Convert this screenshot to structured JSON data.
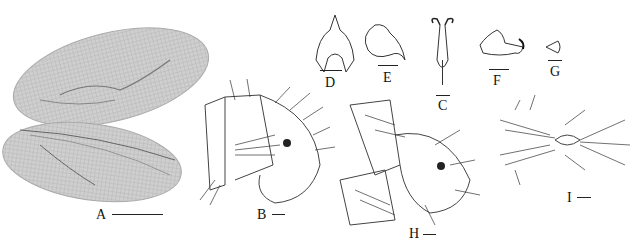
{
  "figure": {
    "panels": [
      {
        "id": "A",
        "label": "A",
        "description": "forewing and hindwing"
      },
      {
        "id": "B",
        "label": "B",
        "description": "male terminalia, lateral view"
      },
      {
        "id": "C",
        "label": "C",
        "description": "gonarcus, dorsal view"
      },
      {
        "id": "D",
        "label": "D",
        "description": "gonarcus, lateral view"
      },
      {
        "id": "E",
        "label": "E",
        "description": "hypandrium internum / parameres"
      },
      {
        "id": "F",
        "label": "F",
        "description": "gonapsis, lateral view"
      },
      {
        "id": "G",
        "label": "G",
        "description": "hypandrium internum"
      },
      {
        "id": "H",
        "label": "H",
        "description": "female terminalia, lateral view"
      },
      {
        "id": "I",
        "label": "I",
        "description": "female terminalia, ventral view"
      }
    ],
    "colors": {
      "ink": "#222222",
      "wing_fill": "#c9c9c9",
      "background": "#ffffff"
    }
  }
}
